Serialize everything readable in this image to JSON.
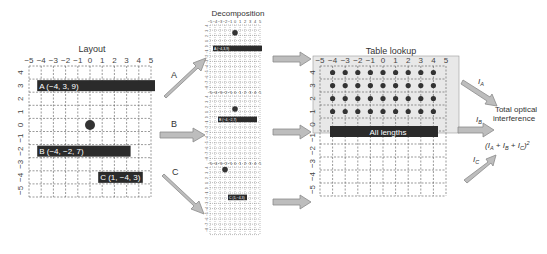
{
  "layout_panel": {
    "title": "Layout",
    "x_ticks": [
      "−5",
      "−4",
      "−3",
      "−2",
      "−1",
      "0",
      "1",
      "2",
      "3",
      "4",
      "5"
    ],
    "y_ticks": [
      "4",
      "3",
      "2",
      "1",
      "0",
      "−1",
      "−2",
      "−3",
      "−4",
      "−5"
    ],
    "bars": [
      {
        "label": "A (−4, 3, 9)",
        "x": -4,
        "y": 3,
        "length": 9
      },
      {
        "label": "B (−4, −2, 7)",
        "x": -4,
        "y": -2,
        "length": 7
      },
      {
        "label": "C (1, −4, 3)",
        "x": 1,
        "y": -4,
        "length": 3
      }
    ],
    "point": {
      "x": 0,
      "y": 0
    }
  },
  "decomposition_panel": {
    "title": "Decomposition",
    "x_ticks": [
      "−5",
      "−4",
      "−3",
      "−2",
      "−1",
      "0",
      "1",
      "2",
      "3",
      "4",
      "5"
    ],
    "sub_bars": [
      {
        "label": "A (−4,3,9)"
      },
      {
        "label": "B (−4,−2,7)"
      },
      {
        "label": "C (1,−4,3)"
      }
    ]
  },
  "arrows": {
    "a_label": "A",
    "b_label": "B",
    "c_label": "C"
  },
  "table_panel": {
    "title": "Table lookup",
    "x_ticks": [
      "−5",
      "−4",
      "−3",
      "−2",
      "−1",
      "0",
      "1",
      "2",
      "3",
      "4",
      "5"
    ],
    "y_ticks": [
      "4",
      "3",
      "2",
      "1",
      "0",
      "−1",
      "−2",
      "−3",
      "−4",
      "−5"
    ],
    "bar_label": "All lengths"
  },
  "output": {
    "ia": "I",
    "ia_sub": "A",
    "ib": "I",
    "ib_sub": "B",
    "ic": "I",
    "ic_sub": "C",
    "title_line1": "Total optical",
    "title_line2": "interference",
    "formula": "(I_A + I_B + I_C)^2"
  },
  "colors": {
    "bar": "#2b2b2b",
    "arrow_fill": "#bdbdbd",
    "arrow_stroke": "#8a8a8a",
    "grid": "#555555",
    "table_bg": "#e8e8e8"
  }
}
